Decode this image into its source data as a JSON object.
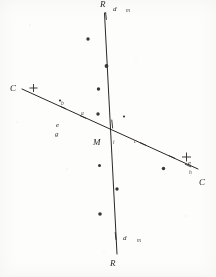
{
  "figure": {
    "background_color": "#fdfdfc",
    "ink_color": "#2a2724",
    "width": 216,
    "height": 277
  },
  "lines": [
    {
      "name": "vertical-line-PR",
      "start_label": "R",
      "end_label": "R",
      "x1": 104.5,
      "y1": 13.0,
      "x2": 117.0,
      "y2": 254.0,
      "stroke": "#2b2825",
      "stroke_width": 1.0
    },
    {
      "name": "diagonal-line-CC",
      "start_label": "C",
      "end_label": "C",
      "x1": 22.0,
      "y1": 89.0,
      "x2": 198.0,
      "y2": 169.0,
      "stroke": "#2b2825",
      "stroke_width": 1.0
    }
  ],
  "labels": {
    "top_endpoint": "R",
    "bottom_endpoint": "R",
    "left_endpoint": "C",
    "right_endpoint": "C",
    "intersection": "M",
    "top_tick": "d",
    "top_tick_small": "m",
    "bottom_tick": "d",
    "bottom_tick_small": "m",
    "left_lower_a": "e",
    "left_lower_b": "g",
    "right_upper": "e",
    "right_tick": "h",
    "diag_left_tick": "b",
    "diag_mid_tick": "a",
    "diag_right_tick": "c",
    "near_center": "i"
  },
  "ticks": [
    {
      "name": "tick-vertical-top",
      "x": 106.0,
      "y": 16.0,
      "angle": 84,
      "len": 7
    },
    {
      "name": "tick-vertical-upper",
      "x": 112.2,
      "y": 124.0,
      "angle": 84,
      "len": 8
    },
    {
      "name": "tick-vertical-bottom",
      "x": 115.6,
      "y": 236.0,
      "angle": 84,
      "len": 7
    },
    {
      "name": "tick-diagonal-left",
      "x": 63.0,
      "y": 107.5,
      "angle": 24,
      "len": 6
    },
    {
      "name": "tick-diagonal-mid",
      "x": 83.0,
      "y": 117.0,
      "angle": 24,
      "len": 6
    },
    {
      "name": "tick-diagonal-right",
      "x": 143.0,
      "y": 144.0,
      "angle": 24,
      "len": 6
    },
    {
      "name": "tick-diagonal-far",
      "x": 172.0,
      "y": 157.0,
      "angle": 24,
      "len": 6
    },
    {
      "name": "tick-diagonal-end",
      "x": 188.0,
      "y": 165.5,
      "angle": 24,
      "len": 6
    }
  ],
  "crosses": [
    {
      "name": "cross-left-end",
      "x": 33.5,
      "y": 88.0,
      "size": 4.0
    },
    {
      "name": "cross-right-end",
      "x": 186.5,
      "y": 157.0,
      "size": 4.5
    }
  ],
  "stars": [
    {
      "name": "star-1",
      "x": 88.0,
      "y": 39.0,
      "r": 1.7
    },
    {
      "name": "star-2",
      "x": 106.5,
      "y": 66.0,
      "r": 1.9
    },
    {
      "name": "star-3",
      "x": 98.5,
      "y": 89.0,
      "r": 1.7
    },
    {
      "name": "star-4",
      "x": 98.0,
      "y": 114.0,
      "r": 1.7
    },
    {
      "name": "star-5",
      "x": 124.0,
      "y": 116.5,
      "r": 1.1
    },
    {
      "name": "star-6",
      "x": 99.5,
      "y": 165.5,
      "r": 1.5
    },
    {
      "name": "star-7",
      "x": 117.0,
      "y": 189.0,
      "r": 1.7
    },
    {
      "name": "star-8",
      "x": 163.5,
      "y": 168.5,
      "r": 1.7
    },
    {
      "name": "star-9",
      "x": 100.0,
      "y": 214.0,
      "r": 1.8
    },
    {
      "name": "star-10",
      "x": 60.0,
      "y": 100.5,
      "r": 1.1
    }
  ]
}
